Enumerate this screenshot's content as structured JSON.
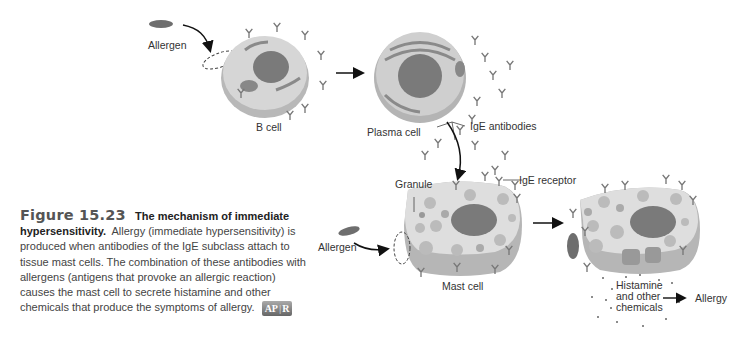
{
  "diagram": {
    "labels": {
      "allergen_top": "Allergen",
      "b_cell": "B cell",
      "plasma_cell": "Plasma cell",
      "ige_antibodies": "IgE antibodies",
      "granule": "Granule",
      "ige_receptor": "IgE receptor",
      "allergen_bottom": "Allergen",
      "mast_cell": "Mast cell",
      "histamine_line1": "Histamine",
      "histamine_line2": "and other",
      "histamine_line3": "chemicals",
      "allergy": "Allergy"
    },
    "colors": {
      "cell_fill": "#d9d9d9",
      "cell_side": "#b3b3b3",
      "nucleus": "#7a7a7a",
      "allergen": "#6e6e6e",
      "arrow": "#111111"
    }
  },
  "caption": {
    "figure_number": "Figure 15.23",
    "title": "The mechanism of immediate hypersensitivity.",
    "body": "Allergy (immediate hypersensitivity) is produced when antibodies of the IgE subclass attach to tissue mast cells. The combination of these antibodies with allergens (antigens that provoke an allergic reaction) causes the mast cell to secrete histamine and other chemicals that produce the symptoms of allergy.",
    "badge_left": "AP",
    "badge_right": "R"
  }
}
